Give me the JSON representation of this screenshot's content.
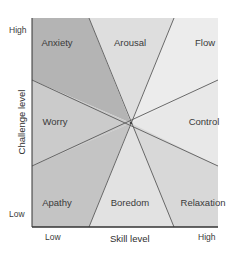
{
  "diagram": {
    "type": "flow-model-octants",
    "x_axis": {
      "title": "Skill level",
      "low": "Low",
      "high": "High"
    },
    "y_axis": {
      "title": "Challenge level",
      "low": "Low",
      "high": "High"
    },
    "regions": [
      {
        "id": "anxiety",
        "label": "Anxiety"
      },
      {
        "id": "arousal",
        "label": "Arousal"
      },
      {
        "id": "flow",
        "label": "Flow"
      },
      {
        "id": "worry",
        "label": "Worry"
      },
      {
        "id": "control",
        "label": "Control"
      },
      {
        "id": "apathy",
        "label": "Apathy"
      },
      {
        "id": "boredom",
        "label": "Boredom"
      },
      {
        "id": "relaxation",
        "label": "Relaxation"
      }
    ],
    "colors": {
      "dark_region": "#b8b8b8",
      "mid_region": "#d4d4d4",
      "light_region": "#f0f0f0",
      "line": "#555555",
      "axis": "#333333"
    }
  }
}
